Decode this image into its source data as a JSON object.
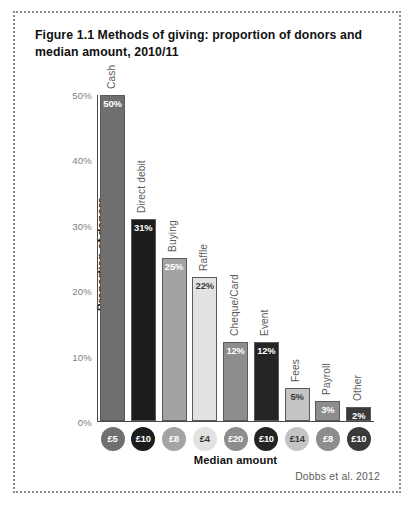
{
  "figure": {
    "title": "Figure 1.1 Methods of giving: proportion of donors and median amount, 2010/11",
    "attribution": "Dobbs et al. 2012"
  },
  "chart_data": {
    "type": "bar",
    "title": "Figure 1.1 Methods of giving: proportion of donors and median amount, 2010/11",
    "xlabel": "Median amount",
    "ylabel": "Proportion of donors",
    "ylim": [
      0,
      50
    ],
    "yticks": [
      0,
      10,
      20,
      30,
      40,
      50
    ],
    "ytick_labels": [
      "0%",
      "10%",
      "20%",
      "30%",
      "40%",
      "50%"
    ],
    "grid": false,
    "legend": "none",
    "categories": [
      "Cash",
      "Direct debit",
      "Buying",
      "Raffle",
      "Cheque/Card",
      "Event",
      "Fees",
      "Payroll",
      "Other"
    ],
    "values": [
      50,
      31,
      25,
      22,
      12,
      12,
      5,
      3,
      2
    ],
    "value_labels": [
      "50%",
      "31%",
      "25%",
      "22%",
      "12%",
      "12%",
      "5%",
      "3%",
      "2%"
    ],
    "median_amounts": [
      "£5",
      "£10",
      "£8",
      "£4",
      "£20",
      "£10",
      "£14",
      "£8",
      "£10"
    ],
    "bar_colors": [
      "#6f6f6f",
      "#1c1c1c",
      "#a3a3a3",
      "#e2e2e2",
      "#8d8d8d",
      "#242424",
      "#c4c4c4",
      "#8d8d8d",
      "#3a3a3a"
    ],
    "value_label_colors": [
      "#ffffff",
      "#ffffff",
      "#ffffff",
      "#3a3a3a",
      "#ffffff",
      "#ffffff",
      "#3a3a3a",
      "#ffffff",
      "#ffffff"
    ],
    "circle_colors": [
      "#6f6f6f",
      "#1c1c1c",
      "#a3a3a3",
      "#e2e2e2",
      "#8d8d8d",
      "#242424",
      "#c4c4c4",
      "#8d8d8d",
      "#3a3a3a"
    ],
    "circle_text_colors": [
      "#ffffff",
      "#ffffff",
      "#ffffff",
      "#3a3a3a",
      "#ffffff",
      "#ffffff",
      "#3a3a3a",
      "#ffffff",
      "#ffffff"
    ]
  }
}
